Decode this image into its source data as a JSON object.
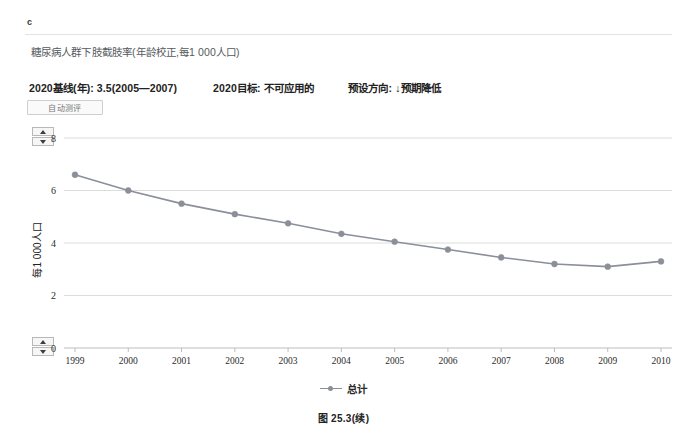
{
  "panel": {
    "letter": "c"
  },
  "indicator": {
    "title": "糖尿病人群下肢截肢率(年龄校正,每1 000人口)"
  },
  "meta": {
    "baseline": "2020基线(年): 3.5(2005—2007)",
    "target": "2020目标: 不可应用的",
    "direction": "预设方向: ↓预期降低"
  },
  "controls": {
    "auto_assess_label": "自动测评",
    "spinner_up_icon": "triangle-up-icon",
    "spinner_down_icon": "triangle-down-icon"
  },
  "caption": {
    "text": "图 25.3(续)"
  },
  "chart_data": {
    "type": "line",
    "title": "糖尿病人群下肢截肢率(年龄校正,每1 000人口)",
    "xlabel": "",
    "ylabel": "每1 000人口",
    "categories": [
      "1999",
      "2000",
      "2001",
      "2002",
      "2003",
      "2004",
      "2005",
      "2006",
      "2007",
      "2008",
      "2009",
      "2010"
    ],
    "series": [
      {
        "name": "总计",
        "values": [
          6.6,
          6.0,
          5.5,
          5.1,
          4.75,
          4.35,
          4.05,
          3.75,
          3.45,
          3.2,
          3.1,
          3.3
        ],
        "color": "#8a8f99",
        "marker": "circle"
      }
    ],
    "ylim": [
      0,
      8
    ],
    "yticks": [
      0,
      2,
      4,
      6,
      8
    ],
    "ytick_labels": [
      "0",
      "2",
      "4",
      "6",
      "8"
    ],
    "grid": true,
    "legend_position": "bottom",
    "legend_entries": [
      "总计"
    ]
  }
}
